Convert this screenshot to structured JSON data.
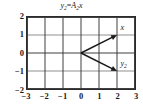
{
  "figure": {
    "title": {
      "lhs": "y",
      "lhs_sub": "2",
      "operator": "=",
      "rhs": "A",
      "rhs_sub": "2",
      "rhs_var": "x",
      "plain": "y2=A2x"
    },
    "colors": {
      "frame": "#2b2b2b",
      "grid_major": "#3a3a3a",
      "grid_minor": "#b5b5b5",
      "vector": "#1a1a1a",
      "background": "#ffffff"
    }
  },
  "chart_data": {
    "type": "scatter",
    "title": "y2=A2x",
    "xlabel": "",
    "ylabel": "",
    "xlim": [
      -3,
      3
    ],
    "ylim": [
      -2,
      2
    ],
    "grid": true,
    "legend": "none",
    "xticks": [
      -3,
      -2,
      -1,
      0,
      1,
      2,
      3
    ],
    "xticklabels": [
      "−3",
      "−2",
      "−1",
      "0",
      "1",
      "2",
      "3"
    ],
    "yticks": [
      -2,
      -1,
      0,
      1,
      2
    ],
    "yticklabels": [
      "−2",
      "−1",
      "0",
      "1",
      "2"
    ],
    "gridlines": {
      "vertical": [
        -3,
        -2,
        -1,
        0,
        1,
        2,
        3
      ],
      "horizontal_major": [
        -2,
        0,
        2
      ],
      "horizontal_minor": [
        -1,
        1
      ]
    },
    "vectors": [
      {
        "name": "x",
        "label": "x",
        "label_sub": "",
        "tail": [
          0,
          0
        ],
        "head": [
          2,
          1
        ],
        "arrow": true,
        "label_pos": [
          2.15,
          1.35
        ]
      },
      {
        "name": "y2",
        "label": "y",
        "label_sub": "2",
        "tail": [
          0,
          0
        ],
        "head": [
          2,
          -1
        ],
        "arrow": true,
        "label_pos": [
          2.15,
          -0.62
        ]
      }
    ]
  }
}
